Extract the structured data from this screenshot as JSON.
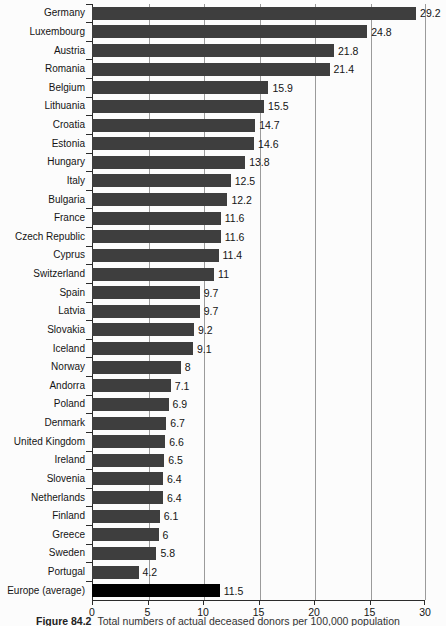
{
  "chart_data": {
    "type": "bar",
    "orientation": "horizontal",
    "title": "",
    "xlabel": "",
    "ylabel": "",
    "categories": [
      "Germany",
      "Luxembourg",
      "Austria",
      "Romania",
      "Belgium",
      "Lithuania",
      "Croatia",
      "Estonia",
      "Hungary",
      "Italy",
      "Bulgaria",
      "France",
      "Czech Republic",
      "Cyprus",
      "Switzerland",
      "Spain",
      "Latvia",
      "Slovakia",
      "Iceland",
      "Norway",
      "Andorra",
      "Poland",
      "Denmark",
      "United Kingdom",
      "Ireland",
      "Slovenia",
      "Netherlands",
      "Finland",
      "Greece",
      "Sweden",
      "Portugal",
      "Europe (average)"
    ],
    "values": [
      29.2,
      24.8,
      21.8,
      21.4,
      15.9,
      15.5,
      14.7,
      14.6,
      13.8,
      12.5,
      12.2,
      11.6,
      11.6,
      11.4,
      11,
      9.7,
      9.7,
      9.2,
      9.1,
      8,
      7.1,
      6.9,
      6.7,
      6.6,
      6.5,
      6.4,
      6.4,
      6.1,
      6,
      5.8,
      4.2,
      11.5
    ],
    "value_labels": [
      "29.2",
      "24.8",
      "21.8",
      "21.4",
      "15.9",
      "15.5",
      "14.7",
      "14.6",
      "13.8",
      "12.5",
      "12.2",
      "11.6",
      "11.6",
      "11.4",
      "11",
      "9.7",
      "9.7",
      "9.2",
      "9.1",
      "8",
      "7.1",
      "6.9",
      "6.7",
      "6.6",
      "6.5",
      "6.4",
      "6.4",
      "6.1",
      "6",
      "5.8",
      "4.2",
      "11.5"
    ],
    "xlim": [
      0,
      30
    ],
    "x_tick_labels": [
      "0",
      "5",
      "10",
      "15",
      "20",
      "15",
      "30"
    ],
    "grid": true,
    "legend": false,
    "bar_color": "#3e3e3e",
    "highlight_category": "Europe (average)",
    "highlight_color": "#000000"
  },
  "caption": {
    "figure_label": "Figure 84.2",
    "text": "Total numbers of actual deceased donors per 100,000 population"
  }
}
